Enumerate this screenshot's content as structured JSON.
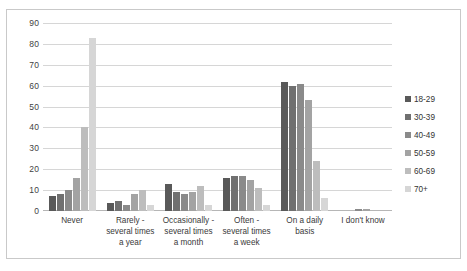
{
  "chart_data": {
    "type": "bar",
    "title": "",
    "subtitle": "",
    "xlabel": "",
    "ylabel": "",
    "ylim": [
      0,
      90
    ],
    "ytick_step": 10,
    "yticks": [
      90,
      80,
      70,
      60,
      50,
      40,
      30,
      20,
      10,
      0
    ],
    "grid": true,
    "legend_position": "right",
    "categories": [
      "Never",
      "Rarely - several times a year",
      "Occasionally - several times a month",
      "Often - several times a week",
      "On a daily basis",
      "I don't know"
    ],
    "category_lines": [
      [
        "Never"
      ],
      [
        "Rarely -",
        "several times",
        "a year"
      ],
      [
        "Occasionally -",
        "several times",
        "a month"
      ],
      [
        "Often -",
        "several times",
        "a week"
      ],
      [
        "On a daily",
        "basis"
      ],
      [
        "I don't know"
      ]
    ],
    "series": [
      {
        "name": "18-29",
        "color": "#595959",
        "values": [
          7,
          4,
          13,
          16,
          62,
          0
        ]
      },
      {
        "name": "30-39",
        "color": "#707070",
        "values": [
          8,
          5,
          9,
          17,
          60,
          0
        ]
      },
      {
        "name": "40-49",
        "color": "#8a8a8a",
        "values": [
          10,
          3,
          8,
          17,
          61,
          1
        ]
      },
      {
        "name": "50-59",
        "color": "#a3a3a3",
        "values": [
          16,
          8,
          9,
          15,
          53,
          1
        ]
      },
      {
        "name": "60-69",
        "color": "#bdbdbd",
        "values": [
          40,
          10,
          12,
          11,
          24,
          0
        ]
      },
      {
        "name": "70+",
        "color": "#d6d6d6",
        "values": [
          83,
          3,
          3,
          3,
          6,
          0
        ]
      }
    ]
  },
  "colors": {
    "frame_border": "#c9c9c9",
    "gridline": "#d6d6d6",
    "baseline": "#b6b6b6",
    "text": "#3a3a3a"
  }
}
